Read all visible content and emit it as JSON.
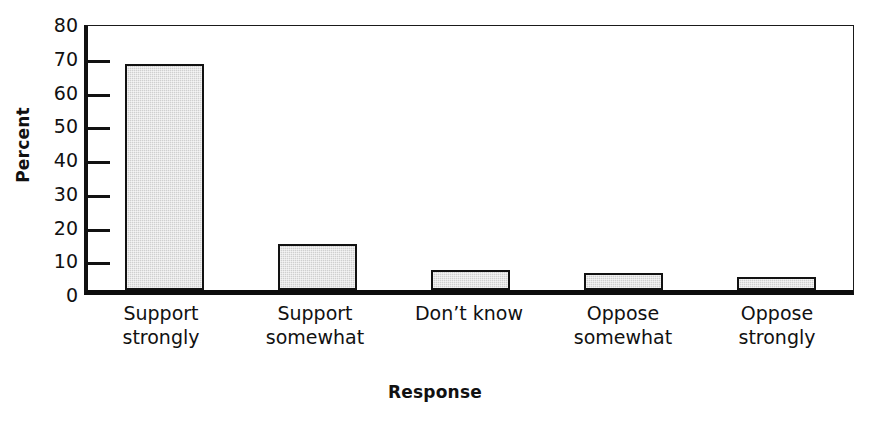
{
  "chart_data": {
    "type": "bar",
    "title": "",
    "xlabel": "Response",
    "ylabel": "Percent",
    "categories": [
      "Support\nstrongly",
      "Support\nsomewhat",
      "Don’t know",
      "Oppose\nsomewhat",
      "Oppose\nstrongly"
    ],
    "values": [
      67,
      13.5,
      6,
      5,
      4
    ],
    "ylim": [
      0,
      80
    ],
    "yticks": [
      0,
      10,
      20,
      30,
      40,
      50,
      60,
      70,
      80
    ],
    "ytick_labels": [
      "0",
      "10",
      "20",
      "30",
      "40",
      "50",
      "60",
      "70",
      "80"
    ],
    "grid": false,
    "legend": null,
    "bar_fill_color": "#cfcfcf",
    "bar_edge_color": "#121212",
    "axis_color": "#111111",
    "background_color": "#ffffff"
  }
}
